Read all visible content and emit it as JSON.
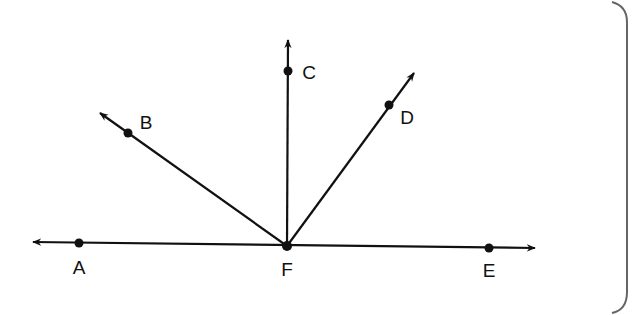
{
  "diagram": {
    "type": "geometry-rays",
    "colors": {
      "stroke": "#111111",
      "border": "#666666",
      "background": "#ffffff"
    },
    "vertex": "F",
    "points": [
      {
        "id": "A",
        "label": "A",
        "x": 79,
        "y": 243,
        "lx": 79,
        "ly": 274
      },
      {
        "id": "B",
        "label": "B",
        "x": 128,
        "y": 133,
        "lx": 146,
        "ly": 129
      },
      {
        "id": "C",
        "label": "C",
        "x": 288,
        "y": 71,
        "lx": 309,
        "ly": 79
      },
      {
        "id": "D",
        "label": "D",
        "x": 389,
        "y": 105,
        "lx": 407,
        "ly": 124
      },
      {
        "id": "E",
        "label": "E",
        "x": 489,
        "y": 248,
        "lx": 489,
        "ly": 277
      },
      {
        "id": "F",
        "label": "F",
        "x": 287,
        "y": 246,
        "lx": 287,
        "ly": 276
      }
    ],
    "lines": [
      {
        "name": "line-AE",
        "from": [
          33,
          242
        ],
        "to": [
          535,
          248
        ],
        "arrows": "both"
      },
      {
        "name": "ray-FB",
        "from": [
          287,
          246
        ],
        "to": [
          100,
          113
        ],
        "arrows": "end"
      },
      {
        "name": "ray-FC",
        "from": [
          287,
          246
        ],
        "to": [
          288,
          40
        ],
        "arrows": "end"
      },
      {
        "name": "ray-FD",
        "from": [
          287,
          246
        ],
        "to": [
          414,
          73
        ],
        "arrows": "end"
      }
    ]
  }
}
